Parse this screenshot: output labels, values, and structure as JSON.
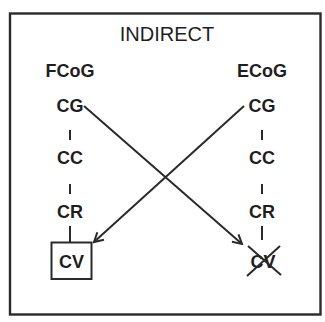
{
  "diagram": {
    "title": "INDIRECT",
    "colors": {
      "stroke": "#2a2a2a",
      "text": "#1e1e1e",
      "background": "#ffffff"
    },
    "columns": [
      {
        "id": "left",
        "header": "FCoG",
        "nodes": [
          "CG",
          "CC",
          "CR",
          "CV"
        ],
        "terminal_state": "boxed"
      },
      {
        "id": "right",
        "header": "ECoG",
        "nodes": [
          "CG",
          "CC",
          "CR",
          "CV"
        ],
        "terminal_state": "crossed-out"
      }
    ],
    "arrows": [
      {
        "from": "left.CG",
        "to": "right.CV",
        "direction": "down-right"
      },
      {
        "from": "right.CG",
        "to": "left.CV",
        "direction": "down-left"
      }
    ]
  }
}
